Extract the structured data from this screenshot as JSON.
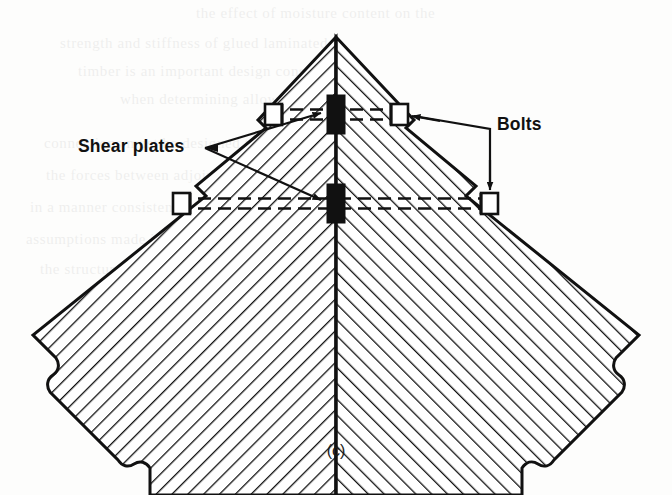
{
  "figure": {
    "caption": "(c)",
    "background_color": "#fdfdfc",
    "ink_color": "#111111"
  },
  "labels": [
    {
      "id": "shear-plates",
      "text": "Shear plates",
      "x": 78,
      "y": 152,
      "anchor": "start",
      "leader_targets": [
        "upper-shear-plate",
        "lower-shear-plate"
      ]
    },
    {
      "id": "bolts",
      "text": "Bolts",
      "x": 497,
      "y": 130,
      "anchor": "start",
      "leader_targets": [
        "upper-right-bolt",
        "lower-right-bolt"
      ]
    }
  ],
  "components": {
    "members": [
      {
        "id": "left-rafter",
        "orientation": "down-left",
        "hatch_angle_deg": 45,
        "end_style": "break-line"
      },
      {
        "id": "right-rafter",
        "orientation": "down-right",
        "hatch_angle_deg": -45,
        "end_style": "break-line"
      }
    ],
    "bolt_lines": [
      {
        "id": "upper-bolt-line",
        "y": 114,
        "x_left": 270,
        "x_right": 404,
        "bolt_count": 2
      },
      {
        "id": "lower-bolt-line",
        "y": 203,
        "x_left": 178,
        "x_right": 494,
        "bolt_count": 2
      }
    ],
    "shear_plates": [
      {
        "id": "upper-shear-plate",
        "cx": 336,
        "cy": 114,
        "width": 17,
        "height": 38
      },
      {
        "id": "lower-shear-plate",
        "cx": 336,
        "cy": 203,
        "width": 17,
        "height": 38
      }
    ],
    "bolts": [
      {
        "id": "upper-left-bolt",
        "cx": 274,
        "cy": 114
      },
      {
        "id": "upper-right-bolt",
        "cx": 400,
        "cy": 114
      },
      {
        "id": "lower-left-bolt",
        "cx": 182,
        "cy": 203
      },
      {
        "id": "lower-right-bolt",
        "cx": 490,
        "cy": 203
      }
    ],
    "apex": {
      "x": 336,
      "y": 37
    }
  },
  "ghost_lines": [
    {
      "text": "the effect of moisture content on the",
      "x": 196,
      "y": 18
    },
    {
      "text": "strength and stiffness of glued laminated",
      "x": 60,
      "y": 48
    },
    {
      "text": "timber is an important design consideration",
      "x": 78,
      "y": 76
    },
    {
      "text": "when determining allowable stresses",
      "x": 120,
      "y": 104
    },
    {
      "text": "connections must be designed to transfer",
      "x": 44,
      "y": 148
    },
    {
      "text": "the forces between adjoining members",
      "x": 46,
      "y": 180
    },
    {
      "text": "in a manner consistent with the",
      "x": 30,
      "y": 212
    },
    {
      "text": "assumptions made in the analysis of",
      "x": 26,
      "y": 244
    },
    {
      "text": "the structure as a whole and shall",
      "x": 40,
      "y": 274
    }
  ]
}
